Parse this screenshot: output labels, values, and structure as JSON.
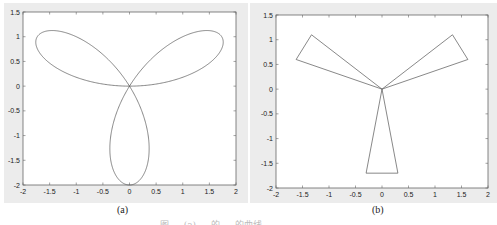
{
  "figure": {
    "subplot_labels": [
      "(a)",
      "(b)"
    ],
    "caption": "图 … (a) … 的 … 的曲线"
  },
  "colors": {
    "panel_bg": "#ececec",
    "axes_bg": "#ffffff",
    "axes_line": "#666666",
    "curve": "#555555"
  },
  "chart_data": [
    {
      "type": "line",
      "title": "",
      "label": "(a)",
      "description": "Three-leaf rose curve r = 2 sin(3θ) in polar form, plotted in Cartesian coordinates",
      "equation": "r = 2*sin(3*theta)",
      "xlabel": "",
      "ylabel": "",
      "xlim": [
        -2,
        2
      ],
      "ylim": [
        -2,
        1.5
      ],
      "xticks": [
        -2,
        -1.5,
        -1,
        -0.5,
        0,
        0.5,
        1,
        1.5,
        2
      ],
      "yticks": [
        -2,
        -1.5,
        -1,
        -0.5,
        0,
        0.5,
        1,
        1.5
      ],
      "xtick_labels": [
        "-2",
        "-1.5",
        "-1",
        "-0.5",
        "0",
        "0.5",
        "1",
        "1.5",
        "2"
      ],
      "ytick_labels": [
        "-2",
        "-1.5",
        "-1",
        "-0.5",
        "0",
        "0.5",
        "1",
        "1.5"
      ],
      "key_points": [
        [
          1.73,
          1.0
        ],
        [
          -1.73,
          1.0
        ],
        [
          0,
          -2
        ],
        [
          0,
          0
        ]
      ],
      "grid": false,
      "legend": null
    },
    {
      "type": "line",
      "title": "",
      "label": "(b)",
      "description": "Three triangular petals meeting at the origin (polygonal approximation of three-leaf rose)",
      "xlabel": "",
      "ylabel": "",
      "xlim": [
        -2,
        2
      ],
      "ylim": [
        -2,
        1.5
      ],
      "xticks": [
        -2,
        -1.5,
        -1,
        -0.5,
        0,
        0.5,
        1,
        1.5,
        2
      ],
      "yticks": [
        -2,
        -1.5,
        -1,
        -0.5,
        0,
        0.5,
        1,
        1.5
      ],
      "xtick_labels": [
        "-2",
        "-1.5",
        "-1",
        "-0.5",
        "0",
        "0.5",
        "1",
        "1.5",
        "2"
      ],
      "ytick_labels": [
        "-2",
        "-1.5",
        "-1",
        "-0.5",
        "0",
        "0.5",
        "1",
        "1.5"
      ],
      "series": [
        {
          "name": "right-petal",
          "x": [
            0,
            1.33,
            1.62,
            0
          ],
          "y": [
            0,
            1.1,
            0.6,
            0
          ]
        },
        {
          "name": "left-petal",
          "x": [
            0,
            -1.33,
            -1.62,
            0
          ],
          "y": [
            0,
            1.1,
            0.6,
            0
          ]
        },
        {
          "name": "bottom-petal",
          "x": [
            0,
            -0.3,
            0.3,
            0
          ],
          "y": [
            0,
            -1.7,
            -1.7,
            0
          ]
        }
      ],
      "grid": false,
      "legend": null
    }
  ]
}
